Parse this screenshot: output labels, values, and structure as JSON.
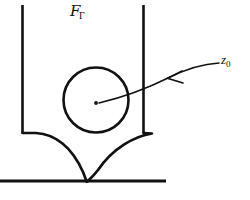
{
  "figure": {
    "type": "geometric-diagram",
    "background_color": "#ffffff",
    "stroke_color": "#111111",
    "width": 250,
    "height": 200,
    "labels": {
      "domain_symbol": "F",
      "domain_subscript": "Γ",
      "domain_label_full": "FΓ",
      "point_symbol": "z",
      "point_subscript": "0",
      "point_label_full": "z0"
    },
    "elements": {
      "left_wall": {
        "name": "left-vertical-wall",
        "x": 22,
        "y_top": 5,
        "y_bottom": 133
      },
      "right_wall": {
        "name": "right-vertical-wall",
        "x": 143,
        "y_top": 5,
        "y_bottom": 133
      },
      "inscribed_circle": {
        "name": "inscribed-circle",
        "cx": 96,
        "cy": 100,
        "r": 32.5
      },
      "center_dot": {
        "name": "marked-point",
        "cx": 96,
        "cy": 103,
        "r": 1.8
      },
      "baseline": {
        "name": "horizontal-baseline",
        "x_start": 0,
        "x_end": 166,
        "y": 181
      },
      "cusp": {
        "name": "cusp-point",
        "x": 86,
        "y": 181
      },
      "left_flare_end": {
        "x": 38,
        "y": 133
      },
      "right_flare_end": {
        "x": 152,
        "y": 133
      },
      "arrow": {
        "name": "pointer-arrow",
        "tail_x": 219,
        "tail_y": 63,
        "head_x": 99,
        "head_y": 103,
        "arrowhead_x": 168,
        "arrowhead_y": 78,
        "direction": "left"
      }
    }
  }
}
